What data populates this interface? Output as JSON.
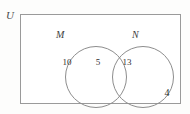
{
  "figure": {
    "type": "venn-diagram",
    "universe_label": "U",
    "sets": [
      {
        "id": "M",
        "label": "M",
        "only_count": "10"
      },
      {
        "id": "N",
        "label": "N",
        "only_count": "13"
      }
    ],
    "intersection_count": "5",
    "outside_count": "4",
    "colors": {
      "rectangle_border": "#9a9a9a",
      "circle_border": "#8d8d8d",
      "text": "#2e2e2e",
      "background": "#ffffff"
    }
  },
  "chart_data": {
    "type": "venn",
    "title": "",
    "universe_label": "U",
    "set_labels": [
      "M",
      "N"
    ],
    "regions": [
      {
        "name": "M only",
        "value": 10
      },
      {
        "name": "M and N",
        "value": 5
      },
      {
        "name": "N only",
        "value": 13
      },
      {
        "name": "outside M and N (in U)",
        "value": 4
      }
    ],
    "totals": {
      "M": 15,
      "N": 18,
      "universe": 32
    }
  }
}
